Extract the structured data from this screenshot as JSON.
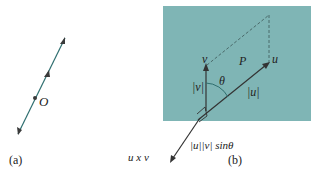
{
  "colors": {
    "plane_fill": "#7fb5b5",
    "line": "#2f4f55",
    "arrow": "#3a3a3a",
    "text": "#222222"
  },
  "panel_a": {
    "point_label": "O",
    "caption": "(a)"
  },
  "panel_b": {
    "vector_v_label": "v",
    "vector_u_label": "u",
    "plane_label": "P",
    "angle_label": "θ",
    "mag_v_label": "|v|",
    "mag_u_label": "|u|",
    "cross_product_label": "u x v",
    "cross_magnitude_label": "|u||v| sinθ",
    "caption": "(b)"
  }
}
